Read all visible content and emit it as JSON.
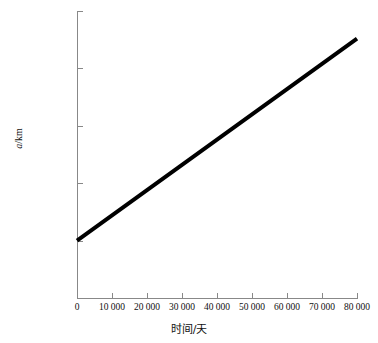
{
  "chart_data": {
    "type": "line",
    "title": "",
    "xlabel": "时间/天",
    "ylabel": "a/km",
    "ylabel_italic_part": "a",
    "ylabel_rest": "/km",
    "xlim": [
      0,
      80000
    ],
    "ylim": [
      190000,
      195000
    ],
    "grid": false,
    "legend": null,
    "x_ticks": [
      0,
      10000,
      20000,
      30000,
      40000,
      50000,
      60000,
      70000,
      80000
    ],
    "x_tick_labels": [
      "0",
      "10 000",
      "20 000",
      "30 000",
      "40 000",
      "50 000",
      "60 000",
      "70 000",
      "80 000"
    ],
    "y_ticks": [
      190000,
      191000,
      192000,
      193000,
      194000,
      195000
    ],
    "y_tick_labels": [
      "190 000",
      "191 000",
      "192 000",
      "193 000",
      "194 000",
      "195 000"
    ],
    "series": [
      {
        "name": "a",
        "color": "#000000",
        "line_width": 4,
        "x": [
          0,
          10000,
          20000,
          30000,
          40000,
          50000,
          60000,
          70000,
          80000
        ],
        "values": [
          191000,
          191440,
          191880,
          192320,
          192760,
          193200,
          193640,
          194080,
          194520
        ]
      }
    ],
    "annotations": []
  },
  "axes": {
    "x_title": "时间/天",
    "y_title_math": "a",
    "y_title_units": "/km"
  },
  "colors": {
    "background": "#ffffff",
    "axis": "#888888",
    "text": "#111111",
    "data_line": "#000000"
  }
}
